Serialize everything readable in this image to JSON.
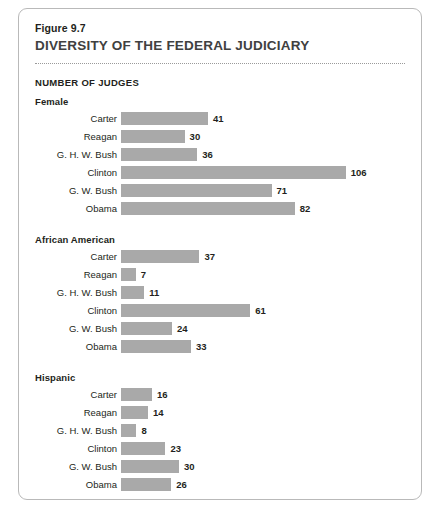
{
  "figure": {
    "number": "Figure 9.7",
    "title": "DIVERSITY OF THE FEDERAL JUDICIARY",
    "unit_label": "NUMBER OF JUDGES"
  },
  "colors": {
    "bar": "#a9a9a9",
    "title": "#404040",
    "text": "#231f20",
    "card_border": "#b9b9b9"
  },
  "chart_data": {
    "type": "bar",
    "title": "DIVERSITY OF THE FEDERAL JUDICIARY",
    "subtitle": "Figure 9.7",
    "xlabel": "NUMBER OF JUDGES",
    "ylabel": "",
    "orientation": "horizontal",
    "grid": false,
    "legend": "none",
    "categories": [
      "Carter",
      "Reagan",
      "G. H. W. Bush",
      "Clinton",
      "G. W. Bush",
      "Obama"
    ],
    "panels": [
      {
        "name": "Female",
        "scale_px_per_unit": 2.12,
        "values": [
          41,
          30,
          36,
          106,
          71,
          82
        ]
      },
      {
        "name": "African American",
        "scale_px_per_unit": 2.12,
        "values": [
          37,
          7,
          11,
          61,
          24,
          33
        ]
      },
      {
        "name": "Hispanic",
        "scale_px_per_unit": 1.93,
        "values": [
          16,
          14,
          8,
          23,
          30,
          26
        ]
      }
    ]
  }
}
